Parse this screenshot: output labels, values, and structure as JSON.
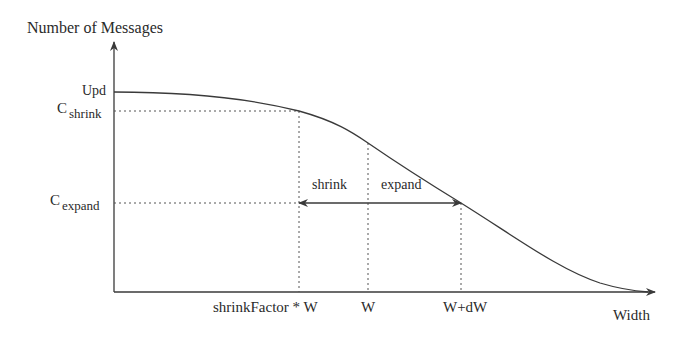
{
  "diagram": {
    "y_axis_label": "Number of Messages",
    "x_axis_label": "Width",
    "y_ticks": [
      {
        "main": "Upd",
        "sub": ""
      },
      {
        "main": "C",
        "sub": "shrink"
      },
      {
        "main": "C",
        "sub": "expand"
      }
    ],
    "x_ticks": [
      "shrinkFactor * W",
      "W",
      "W+dW"
    ],
    "arrow_labels": {
      "shrink": "shrink",
      "expand": "expand"
    },
    "curve_description": "Monotonically decreasing sigmoid-like curve: starts flat at Upd, passes C_shrink at shrinkFactor*W, passes C_expand at W+dW, approaches zero near right end of Width axis",
    "colors": {
      "line": "#3a3a3a",
      "background": "#ffffff"
    }
  }
}
